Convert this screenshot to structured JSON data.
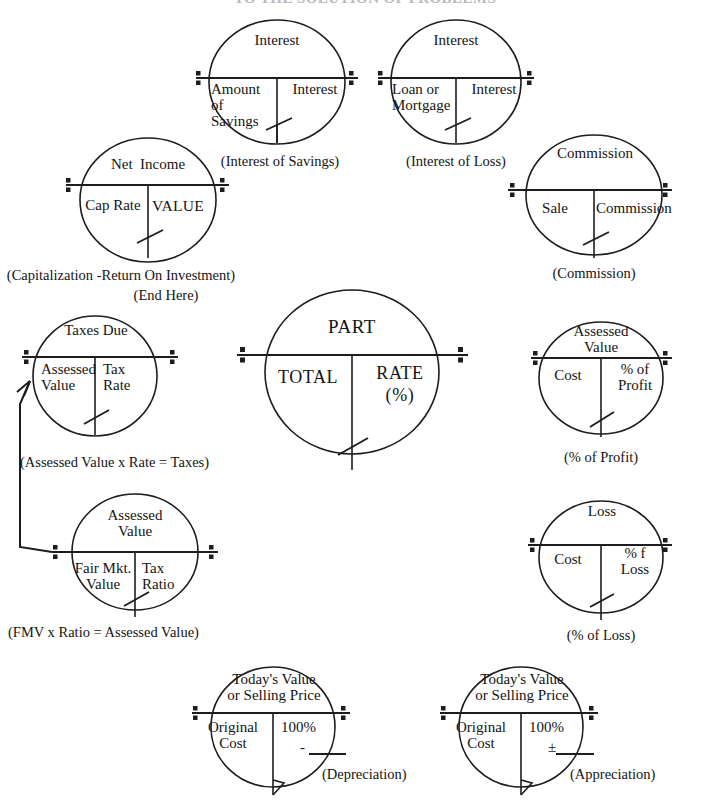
{
  "page": {
    "title_faint": "TO THE SOLUTION OF PROBLEMS",
    "line_color": "#1d1d1d",
    "text_color": "#141414"
  },
  "center_circle": {
    "name": "part-total-rate",
    "numerator": "PART",
    "denominator_left": "TOTAL",
    "denominator_right": "RATE",
    "denominator_right_2": "(%)"
  },
  "circles": [
    {
      "id": "interest-of-savings",
      "numerator": "Interest",
      "left": "Amount\nof\nSavings",
      "right": "Interest",
      "caption": "(Interest of Savings)"
    },
    {
      "id": "interest-of-loss",
      "numerator": "Interest",
      "left": "Loan or\nMortgage",
      "right": "Interest",
      "caption": "(Interest of Loss)"
    },
    {
      "id": "capitalization",
      "numerator": "Net  Income",
      "left": "Cap Rate",
      "right": "VALUE",
      "caption": "(Capitalization -Return On Investment)",
      "caption2": "(End Here)"
    },
    {
      "id": "commission",
      "numerator": "Commission",
      "left": "Sale",
      "right": "Commission",
      "caption": "(Commission)"
    },
    {
      "id": "taxes-due",
      "numerator": "Taxes Due",
      "left": "Assessed\nValue",
      "right": "Tax\nRate",
      "caption": "(Assessed Value x Rate = Taxes)"
    },
    {
      "id": "percent-of-profit",
      "numerator": "Profit",
      "left": "Cost",
      "right": "% of\nProfit",
      "caption": "(% of Profit)"
    },
    {
      "id": "assessed-value",
      "numerator": "Assessed\nValue",
      "left": "Fair Mkt.\nValue",
      "right": "Tax\nRatio",
      "caption": "(FMV x Ratio = Assessed Value)"
    },
    {
      "id": "percent-of-loss",
      "numerator": "Loss",
      "left": "Cost",
      "right": "% f\nLoss",
      "caption": "(% of Loss)"
    },
    {
      "id": "depreciation",
      "numerator": "Today's Value\nor Selling Price",
      "left": "Original\nCost",
      "right": "100%",
      "right_sign": "-",
      "caption": "(Depreciation)"
    },
    {
      "id": "appreciation",
      "numerator": "Today's Value\nor Selling Price",
      "left": "Original\nCost",
      "right": "100%",
      "right_sign": "±",
      "caption": "(Appreciation)"
    }
  ]
}
